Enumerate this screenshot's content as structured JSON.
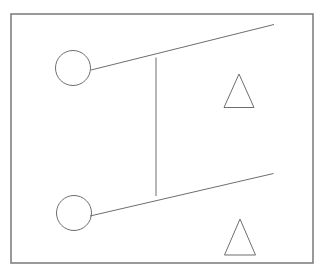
{
  "canvas": {
    "width": 329,
    "height": 277,
    "background_color": "#ffffff",
    "title": "Line drawing: two circles, two triangles, connecting lines inside a rectangular frame"
  },
  "style": {
    "stroke_color": "#6e6e6e",
    "frame_stroke_color": "#808080",
    "stroke_width": 1,
    "frame_stroke_width": 1.6,
    "fill": "none"
  },
  "shapes": {
    "frame": {
      "label": "rectangular border frame",
      "x": 11,
      "y": 14,
      "width": 302,
      "height": 249
    },
    "circles": [
      {
        "label": "upper circle",
        "cx": 73,
        "cy": 68,
        "r": 17.5
      },
      {
        "label": "lower circle",
        "cx": 74,
        "cy": 213,
        "r": 17.5
      }
    ],
    "triangles": [
      {
        "label": "upper triangle",
        "points": "239,74 224,107.5 254,107.5"
      },
      {
        "label": "lower triangle",
        "points": "240,219 224.5,255 255.5,255"
      }
    ],
    "lines": [
      {
        "label": "upper diagonal line",
        "x1": 91,
        "y1": 70,
        "x2": 274,
        "y2": 24.5
      },
      {
        "label": "lower diagonal line",
        "x1": 90,
        "y1": 216,
        "x2": 273.5,
        "y2": 173.5
      },
      {
        "label": "vertical connector line",
        "x1": 156,
        "y1": 57.5,
        "x2": 156,
        "y2": 196
      }
    ]
  }
}
